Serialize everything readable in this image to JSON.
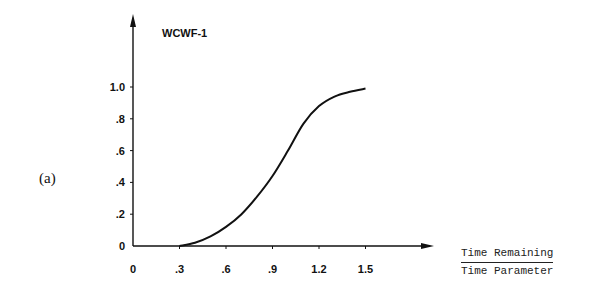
{
  "panel_label": "(a)",
  "chart_data": {
    "type": "line",
    "title": "WCWF-1",
    "xlabel_numerator": "Time Remaining",
    "xlabel_denominator": "Time Parameter",
    "ylabel": "",
    "x_ticks": [
      "0",
      ".3",
      ".6",
      ".9",
      "1.2",
      "1.5"
    ],
    "x_tick_values": [
      0,
      0.3,
      0.6,
      0.9,
      1.2,
      1.5
    ],
    "y_ticks": [
      "0",
      ".2",
      ".4",
      ".6",
      ".8",
      "1.0"
    ],
    "y_tick_values": [
      0,
      0.2,
      0.4,
      0.6,
      0.8,
      1.0
    ],
    "xlim": [
      0,
      1.7
    ],
    "ylim": [
      0,
      1.2
    ],
    "grid": false,
    "legend": null,
    "series": [
      {
        "name": "WCWF-1",
        "x": [
          0.3,
          0.4,
          0.5,
          0.6,
          0.7,
          0.8,
          0.9,
          1.0,
          1.1,
          1.2,
          1.3,
          1.4,
          1.5
        ],
        "y": [
          0.0,
          0.02,
          0.06,
          0.12,
          0.2,
          0.31,
          0.44,
          0.6,
          0.77,
          0.88,
          0.94,
          0.97,
          0.99
        ]
      }
    ]
  }
}
